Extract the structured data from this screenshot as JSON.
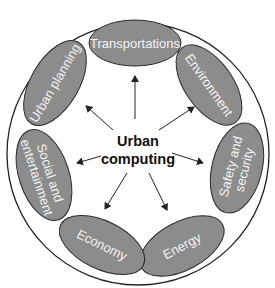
{
  "diagram": {
    "type": "radial",
    "center": {
      "line1": "Urban",
      "line2": "computing"
    },
    "nodes": [
      {
        "id": "transportations",
        "label": "Transportations"
      },
      {
        "id": "environment",
        "label": "Environment"
      },
      {
        "id": "safety",
        "line1": "Safety and",
        "line2": "security"
      },
      {
        "id": "energy",
        "label": "Energy"
      },
      {
        "id": "economy",
        "label": "Economy"
      },
      {
        "id": "social",
        "line1": "Social and",
        "line2": "entertainment"
      },
      {
        "id": "urban-planning",
        "label": "Urban planning"
      }
    ],
    "colors": {
      "node_fill": "#8c8c8c",
      "node_stroke": "#2a2a2a",
      "node_text": "#f4f4f4",
      "outer_circle": "#222222",
      "arrow": "#222222",
      "center_text": "#111111"
    }
  }
}
